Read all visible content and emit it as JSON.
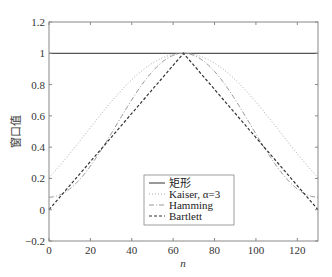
{
  "chart_data": {
    "type": "line",
    "title": "",
    "xlabel": "n",
    "ylabel": "窗口值",
    "xlim": [
      0,
      130
    ],
    "ylim": [
      -0.2,
      1.2
    ],
    "xticks": [
      0,
      20,
      40,
      60,
      80,
      100,
      120
    ],
    "yticks": [
      -0.2,
      0,
      0.2,
      0.4,
      0.6,
      0.8,
      1,
      1.2
    ],
    "ytick_labels": [
      "−0.2",
      "0",
      "0.2",
      "0.4",
      "0.6",
      "0.8",
      "1",
      "1.2"
    ],
    "grid": false,
    "legend_position": "lower center",
    "N": 131,
    "series": [
      {
        "name": "矩形",
        "style": "solid",
        "formula": "w[n]=1",
        "x_range": [
          0,
          130
        ],
        "values_sample": {
          "0": 1,
          "65": 1,
          "130": 1
        }
      },
      {
        "name": "Kaiser, α=3",
        "style": "dotted",
        "formula": "I0(3*sqrt(1-((n-65)/65)^2))/I0(3)",
        "values_sample": {
          "0": 0.205,
          "65": 1,
          "130": 0.205
        }
      },
      {
        "name": "Hamming",
        "style": "dashdot",
        "formula": "0.54-0.46*cos(2*pi*n/130)",
        "values_sample": {
          "0": 0.08,
          "65": 1,
          "130": 0.08
        }
      },
      {
        "name": "Bartlett",
        "style": "dashed",
        "formula": "1-|n-65|/65",
        "values_sample": {
          "0": 0,
          "65": 1,
          "130": 0
        }
      }
    ]
  },
  "legend": {
    "items": [
      {
        "label": "矩形"
      },
      {
        "label": "Kaiser, α=3"
      },
      {
        "label": "Hamming"
      },
      {
        "label": "Bartlett"
      }
    ]
  },
  "axes": {
    "xlabel": "n",
    "ylabel": "窗口值"
  }
}
